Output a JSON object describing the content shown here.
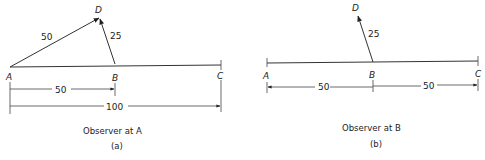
{
  "panels": [
    {
      "id": "a",
      "points": {
        "A": "A",
        "B": "B",
        "C": "C",
        "D": "D"
      },
      "vectors": [
        {
          "from": "A",
          "to": "D",
          "label": "50"
        },
        {
          "from": "B",
          "to": "D",
          "label": "25"
        }
      ],
      "dimensions": [
        {
          "from": "A",
          "to": "B",
          "label": "50"
        },
        {
          "from": "A",
          "to": "C",
          "label": "100"
        }
      ],
      "caption": "Observer at A",
      "sublabel": "(a)"
    },
    {
      "id": "b",
      "points": {
        "A": "A",
        "B": "B",
        "C": "C",
        "D": "D"
      },
      "vectors": [
        {
          "from": "B",
          "to": "D",
          "label": "25"
        }
      ],
      "dimensions": [
        {
          "from": "B",
          "to": "A",
          "label": "50"
        },
        {
          "from": "B",
          "to": "C",
          "label": "50"
        }
      ],
      "caption": "Observer at B",
      "sublabel": "(b)"
    }
  ]
}
